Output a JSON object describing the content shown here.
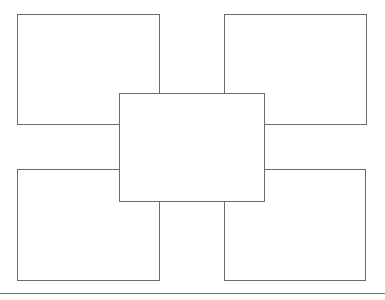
{
  "page": {
    "background_color": "#ffffff",
    "line_color": "#6a6a6a",
    "rule_color": "#6f6f6f",
    "width": 385,
    "height": 300
  },
  "organizer": {
    "type": "concept-map-template",
    "center": {
      "id": "center",
      "text": "",
      "x": 119,
      "y": 93,
      "width": 146,
      "height": 109
    },
    "satellites": [
      {
        "id": "top-left",
        "text": "",
        "x": 17,
        "y": 14,
        "width": 143,
        "height": 111
      },
      {
        "id": "top-right",
        "text": "",
        "x": 224,
        "y": 14,
        "width": 143,
        "height": 111
      },
      {
        "id": "bottom-left",
        "text": "",
        "x": 17,
        "y": 169,
        "width": 143,
        "height": 112
      },
      {
        "id": "bottom-right",
        "text": "",
        "x": 224,
        "y": 169,
        "width": 142,
        "height": 112
      }
    ]
  },
  "footer": {
    "rule": {
      "y": 293,
      "text": ""
    }
  }
}
